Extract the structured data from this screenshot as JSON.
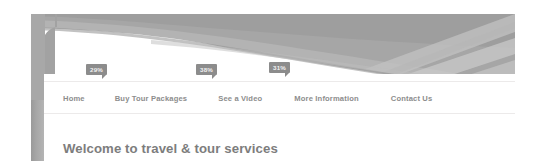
{
  "site": {
    "banner": {
      "name": "travel-tour-banner",
      "style": "curved-rays-grayscale"
    },
    "nav": {
      "items": [
        {
          "label": "Home"
        },
        {
          "label": "Buy Tour Packages"
        },
        {
          "label": "See a Video"
        },
        {
          "label": "More Information"
        },
        {
          "label": "Contact Us"
        }
      ]
    },
    "badges": [
      {
        "value": "29%"
      },
      {
        "value": "38%"
      },
      {
        "value": "31%"
      }
    ],
    "heading": "Welcome to travel & tour services",
    "colors": {
      "badge_background": "#8c8c8c",
      "badge_text": "#f2f2f2",
      "nav_text": "#8d8d8d",
      "heading_text": "#7d7d7d",
      "frame_bar": "#a8a8a8",
      "banner_dark": "#9b9b9b",
      "banner_mid": "#b0b0b0",
      "banner_light": "#c6c6c6",
      "page_background": "#ffffff",
      "separator": "#eceaea"
    }
  }
}
